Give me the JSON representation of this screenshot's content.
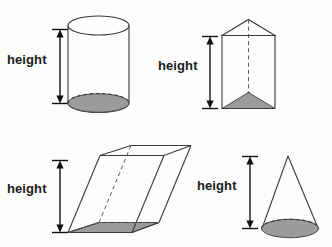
{
  "page": {
    "background_color": "#fdfdfc",
    "ink_color": "#3a3a3a",
    "shade_color": "#9b9b9b",
    "width": 332,
    "height": 247
  },
  "figures": [
    {
      "id": "cylinder",
      "name": "cylinder",
      "label": "height",
      "label_position": "left",
      "base_shaded": true,
      "hidden_edges": false,
      "quadrant": "top-left"
    },
    {
      "id": "triangular-prism",
      "name": "triangular prism",
      "label": "height",
      "label_position": "left",
      "base_shaded": true,
      "hidden_edges": true,
      "quadrant": "top-right"
    },
    {
      "id": "oblique-prism",
      "name": "oblique prism",
      "label": "height",
      "label_position": "left",
      "base_shaded": true,
      "hidden_edges": true,
      "quadrant": "bottom-left"
    },
    {
      "id": "cone",
      "name": "cone",
      "label": "height",
      "label_position": "left",
      "base_shaded": true,
      "hidden_edges": false,
      "quadrant": "bottom-right"
    }
  ]
}
